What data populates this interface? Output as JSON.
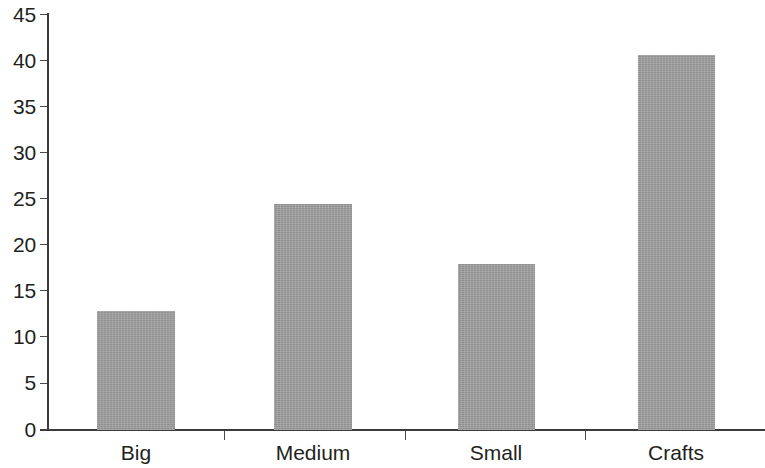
{
  "chart_data": {
    "type": "bar",
    "title": "",
    "subtitle": "",
    "xlabel": "",
    "ylabel": "",
    "categories": [
      "Big",
      "Medium",
      "Small",
      "Crafts"
    ],
    "values": [
      12.9,
      24.5,
      18.0,
      40.6
    ],
    "ylim": [
      0,
      45
    ],
    "ytick_values": [
      0,
      5,
      10,
      15,
      20,
      25,
      30,
      35,
      40,
      45
    ],
    "ytick_labels": [
      "0",
      "5",
      "10",
      "15",
      "20",
      "25",
      "30",
      "35",
      "40",
      "45"
    ],
    "grid": false,
    "legend": null,
    "bar_color": "#9d9d9d",
    "axis_color": "#3b3b3b",
    "text_color": "#231f20",
    "background": "#ffffff"
  }
}
